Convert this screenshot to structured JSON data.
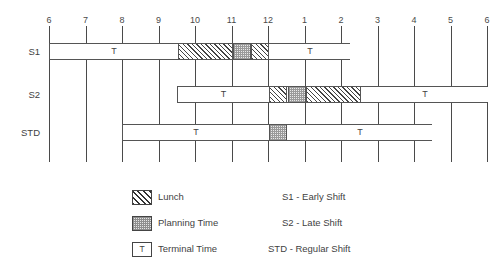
{
  "chart_data": {
    "type": "bar",
    "title": "",
    "xlabel": "",
    "ylabel": "",
    "grid": true,
    "legend_position": "bottom",
    "axis": {
      "ticks": [
        "6",
        "7",
        "8",
        "9",
        "10",
        "11",
        "12",
        "1",
        "2",
        "3",
        "4",
        "5",
        "6"
      ],
      "tick_hours": [
        6,
        7,
        8,
        9,
        10,
        11,
        12,
        13,
        14,
        15,
        16,
        17,
        18
      ],
      "xlim_hours": [
        6,
        18
      ]
    },
    "categories": [
      "S1",
      "S2",
      "STD"
    ],
    "rows": [
      {
        "label": "S1",
        "start_hour": 6,
        "end_hour": 14.25,
        "segments": [
          {
            "type": "terminal",
            "label": "T",
            "start_hour": 6,
            "end_hour": 9.5
          },
          {
            "type": "lunch",
            "label": "Lunch",
            "start_hour": 9.5,
            "end_hour": 11
          },
          {
            "type": "planning",
            "label": "Planning Time",
            "start_hour": 11,
            "end_hour": 11.5
          },
          {
            "type": "lunch",
            "label": "Lunch",
            "start_hour": 11.5,
            "end_hour": 12
          },
          {
            "type": "terminal",
            "label": "T",
            "start_hour": 12,
            "end_hour": 14.25
          }
        ]
      },
      {
        "label": "S2",
        "start_hour": 9.5,
        "end_hour": 18,
        "segments": [
          {
            "type": "terminal",
            "label": "T",
            "start_hour": 9.5,
            "end_hour": 12
          },
          {
            "type": "lunch",
            "label": "Lunch",
            "start_hour": 12,
            "end_hour": 12.5
          },
          {
            "type": "planning",
            "label": "Planning Time",
            "start_hour": 12.5,
            "end_hour": 13
          },
          {
            "type": "lunch",
            "label": "Lunch",
            "start_hour": 13,
            "end_hour": 14.5
          },
          {
            "type": "terminal",
            "label": "T",
            "start_hour": 14.5,
            "end_hour": 18
          }
        ]
      },
      {
        "label": "STD",
        "start_hour": 8,
        "end_hour": 16.5,
        "segments": [
          {
            "type": "terminal",
            "label": "T",
            "start_hour": 8,
            "end_hour": 12
          },
          {
            "type": "planning",
            "label": "Planning Time",
            "start_hour": 12,
            "end_hour": 12.5
          },
          {
            "type": "terminal",
            "label": "T",
            "start_hour": 12.5,
            "end_hour": 16.5
          }
        ]
      }
    ]
  },
  "legend": {
    "patterns": [
      {
        "key": "lunch",
        "label": "Lunch",
        "swatch": "diagonal-hatch"
      },
      {
        "key": "plan",
        "label": "Planning Time",
        "swatch": "dotted-fill"
      },
      {
        "key": "term",
        "label": "Terminal Time",
        "swatch": "letter-T",
        "swatch_text": "T"
      }
    ],
    "shifts": [
      {
        "code": "S1",
        "label": "S1 - Early Shift"
      },
      {
        "code": "S2",
        "label": "S2 - Late Shift"
      },
      {
        "code": "STD",
        "label": "STD - Regular Shift"
      }
    ]
  },
  "colors": {
    "line": "#4a4a4a",
    "text": "#3f3f3f",
    "background": "#ffffff",
    "hatch": "#444444",
    "planning_fill": "#e9e9e9"
  }
}
